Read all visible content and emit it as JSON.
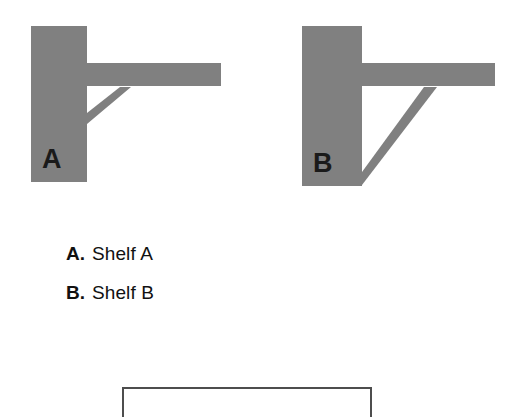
{
  "page": {
    "background_color": "#ffffff",
    "shape_fill_color": "#808080",
    "letter_color": "#1a1a1a",
    "text_color": "#111111",
    "box_border_color": "#4d4d4d"
  },
  "diagrams": [
    {
      "name": "shelf-a",
      "letter": "A",
      "wall": {
        "x": 31,
        "y": 26,
        "width": 56,
        "height": 156
      },
      "arm": {
        "x": 87,
        "y": 63,
        "width": 134,
        "height": 23
      },
      "brace": {
        "from_x": 87,
        "from_y": 122,
        "to_x": 128,
        "to_y": 87
      },
      "letter_x": 55,
      "letter_y": 168
    },
    {
      "name": "shelf-b",
      "letter": "B",
      "wall": {
        "x": 302,
        "y": 26,
        "width": 60,
        "height": 160
      },
      "arm": {
        "x": 362,
        "y": 63,
        "width": 133,
        "height": 23
      },
      "brace": {
        "from_x": 362,
        "from_y": 182,
        "to_x": 433,
        "to_y": 87
      },
      "letter_x": 326,
      "letter_y": 172
    }
  ],
  "options": [
    {
      "key": "A.",
      "label": "Shelf A"
    },
    {
      "key": "B.",
      "label": "Shelf B"
    }
  ],
  "answer_box": {
    "value": "",
    "placeholder": ""
  }
}
